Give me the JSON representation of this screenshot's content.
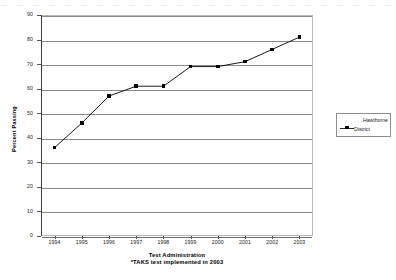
{
  "chart_data": {
    "type": "line",
    "title": "",
    "subtitle": "",
    "xlabel": "Test Administration",
    "ylabel": "Percent Passing",
    "note": "*TAKS test implemented in 2003",
    "categories": [
      "1994",
      "1995",
      "1996",
      "1997",
      "1998",
      "1999",
      "2000",
      "2001",
      "2002",
      "2003"
    ],
    "x": [
      1994,
      1995,
      1996,
      1997,
      1998,
      1999,
      2000,
      2001,
      2002,
      2003
    ],
    "series": [
      {
        "name": "Hawthorne District",
        "values": [
          36,
          46,
          57,
          61,
          61,
          69,
          69,
          71,
          76,
          81
        ],
        "color": "#000000",
        "marker": "square"
      }
    ],
    "ylim": [
      0,
      90
    ],
    "ytick_step": 10,
    "yticks": [
      "0",
      "10",
      "20",
      "30",
      "40",
      "50",
      "60",
      "70",
      "80",
      "90"
    ],
    "grid": true,
    "grid_axis": "y",
    "legend_position": "right"
  },
  "legend": {
    "line1": "Hawthorne",
    "line2": "District"
  },
  "axes": {
    "y_title": "Percent Passing",
    "x_title": "Test Administration",
    "x_note": "*TAKS test implemented in 2003"
  }
}
